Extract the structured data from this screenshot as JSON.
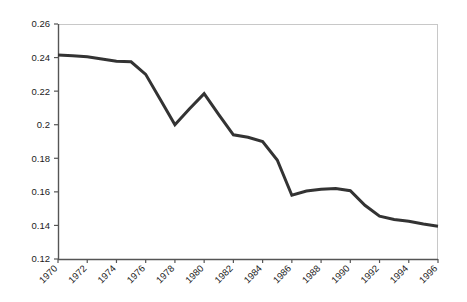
{
  "chart_data": {
    "type": "line",
    "title": "",
    "subtitle": "",
    "xlabel": "",
    "ylabel": "",
    "x": [
      1970,
      1971,
      1972,
      1973,
      1974,
      1975,
      1976,
      1977,
      1978,
      1979,
      1980,
      1981,
      1982,
      1983,
      1984,
      1985,
      1986,
      1987,
      1988,
      1989,
      1990,
      1991,
      1992,
      1993,
      1994,
      1995,
      1996
    ],
    "values": [
      0.2415,
      0.2411,
      0.2405,
      0.2392,
      0.2378,
      0.2375,
      0.23,
      0.215,
      0.2,
      0.2095,
      0.2185,
      0.206,
      0.194,
      0.1925,
      0.19,
      0.179,
      0.158,
      0.1605,
      0.1615,
      0.162,
      0.1607,
      0.152,
      0.1455,
      0.1435,
      0.1425,
      0.1408,
      0.1395
    ],
    "series": [
      {
        "name": "series-1",
        "color": "#333333",
        "values": [
          0.2415,
          0.2411,
          0.2405,
          0.2392,
          0.2378,
          0.2375,
          0.23,
          0.215,
          0.2,
          0.2095,
          0.2185,
          0.206,
          0.194,
          0.1925,
          0.19,
          0.179,
          0.158,
          0.1605,
          0.1615,
          0.162,
          0.1607,
          0.152,
          0.1455,
          0.1435,
          0.1425,
          0.1408,
          0.1395
        ]
      }
    ],
    "xlim": [
      1970,
      1996
    ],
    "ylim": [
      0.12,
      0.26
    ],
    "grid": false,
    "legend": false,
    "legend_position": "none",
    "y_ticks": [
      0.12,
      0.14,
      0.16,
      0.18,
      0.2,
      0.22,
      0.24,
      0.26
    ],
    "y_tick_labels": [
      "0.12",
      "0.14",
      "0.16",
      "0.18",
      "0.2",
      "0.22",
      "0.24",
      "0.26"
    ],
    "x_ticks": [
      1970,
      1972,
      1974,
      1976,
      1978,
      1980,
      1982,
      1984,
      1986,
      1988,
      1990,
      1992,
      1994,
      1996
    ],
    "x_tick_labels": [
      "1970",
      "1972",
      "1974",
      "1976",
      "1978",
      "1980",
      "1982",
      "1984",
      "1986",
      "1988",
      "1990",
      "1992",
      "1994",
      "1996"
    ],
    "x_tick_label_rotation": -45,
    "line_width": 3,
    "markers": false,
    "colors": {
      "line": "#333333",
      "axis": "#555555",
      "frame": "#c8c8c8",
      "text": "#1b1b1b",
      "background": "#ffffff",
      "plot_background": "#ffffff"
    }
  },
  "plot": {
    "left": 58,
    "right": 438,
    "top": 24,
    "bottom": 259
  }
}
